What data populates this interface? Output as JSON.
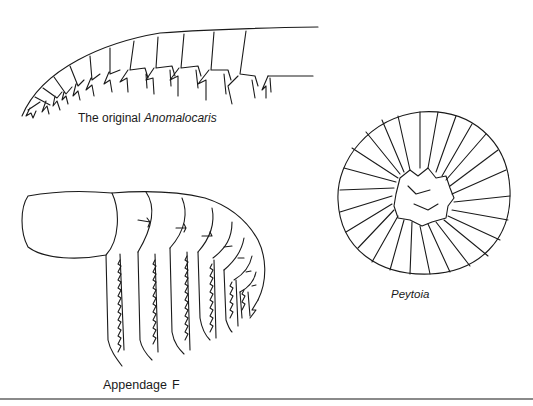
{
  "figure": {
    "panels": [
      {
        "id": "anomalocaris",
        "caption_prefix": "The original",
        "caption_taxon": "Anomalocaris",
        "segments_visible": 13
      },
      {
        "id": "appendage-f",
        "caption_label": "Appendage",
        "caption_letter": "F",
        "segments_visible": 11
      },
      {
        "id": "peytoia",
        "caption_taxon": "Peytoia",
        "radial_plates": 32
      }
    ],
    "colors": {
      "ink": "#1a1a1a",
      "background": "#ffffff",
      "rule": "#8a8a8a"
    }
  }
}
